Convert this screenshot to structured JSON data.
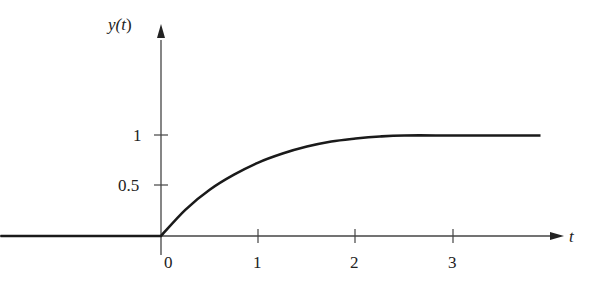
{
  "chart_data": {
    "type": "line",
    "title": "",
    "xlabel": "t",
    "ylabel": "y(t)",
    "xlim": [
      -1.65,
      4.1
    ],
    "ylim": [
      0,
      1.3
    ],
    "grid": false,
    "legend": null,
    "x_ticks": [
      0,
      1,
      2,
      3
    ],
    "x_tick_labels": [
      "0",
      "1",
      "2",
      "3"
    ],
    "y_ticks": [
      0.5,
      1
    ],
    "y_tick_labels": [
      "0.5",
      "1"
    ],
    "series": [
      {
        "name": "y(t)",
        "x": [
          -1.65,
          0,
          0.25,
          0.5,
          0.75,
          1.0,
          1.25,
          1.5,
          1.75,
          2.0,
          2.25,
          2.5,
          3.0,
          3.5,
          3.9
        ],
        "y": [
          0,
          0,
          0.26,
          0.46,
          0.61,
          0.73,
          0.82,
          0.89,
          0.94,
          0.97,
          0.99,
          1.0,
          1.0,
          1.0,
          1.0
        ]
      }
    ]
  },
  "axes": {
    "x_label": "t",
    "y_label_main": "y(",
    "y_label_var": "t",
    "y_label_close": ")",
    "x_tick_labels": [
      "0",
      "1",
      "2",
      "3"
    ],
    "y_tick_labels": [
      "0.5",
      "1"
    ]
  }
}
